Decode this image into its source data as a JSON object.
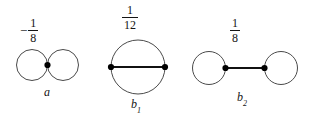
{
  "figure": {
    "background_color": "#ffffff",
    "stroke_color": "#444444",
    "edge_color": "#111111",
    "vertex_color": "#000000",
    "text_color": "#141414",
    "diagrams": [
      {
        "id": "a",
        "shape": "figure-eight",
        "name_label": "a",
        "name_subscript": "",
        "coefficient": {
          "sign": "−",
          "numerator": "1",
          "denominator": "8",
          "value": "-1/8"
        },
        "vertices": 1,
        "loops": 2
      },
      {
        "id": "b1",
        "shape": "circle-with-diameter",
        "name_label": "b",
        "name_subscript": "1",
        "coefficient": {
          "sign": "",
          "numerator": "1",
          "denominator": "12",
          "value": "1/12"
        },
        "vertices": 2,
        "loops": 1
      },
      {
        "id": "b2",
        "shape": "dumbbell",
        "name_label": "b",
        "name_subscript": "2",
        "coefficient": {
          "sign": "",
          "numerator": "1",
          "denominator": "8",
          "value": "1/8"
        },
        "vertices": 2,
        "loops": 2
      }
    ]
  }
}
